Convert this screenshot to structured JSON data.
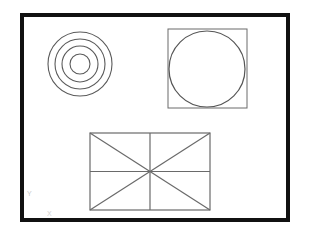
{
  "canvas": {
    "width": 309,
    "height": 232,
    "background_color": "#ffffff",
    "title": "CAD geometric shapes drawing sheet"
  },
  "border_frame": {
    "name": "drawing-border-frame",
    "x": 20,
    "y": 13,
    "width": 270,
    "height": 209,
    "stroke_color": "#111111",
    "stroke_width": 4,
    "fill": "none"
  },
  "shapes": {
    "concentric_circles": {
      "label": "concentric-circles-group",
      "center_x": 80,
      "center_y": 64,
      "stroke_color": "#5a5a5a",
      "stroke_width": 1.1,
      "fill": "none",
      "rings": [
        {
          "name": "ring-outer",
          "radius": 32
        },
        {
          "name": "ring-third",
          "radius": 25
        },
        {
          "name": "ring-second",
          "radius": 18
        },
        {
          "name": "ring-inner",
          "radius": 10
        }
      ]
    },
    "square_with_inscribed_circle": {
      "label": "square-with-inscribed-circle-group",
      "square": {
        "name": "outer-square",
        "x": 168,
        "y": 29,
        "width": 79,
        "height": 79,
        "stroke_color": "#6a6a6a",
        "stroke_width": 1,
        "fill": "none"
      },
      "circle": {
        "name": "inscribed-circle",
        "center_x": 207,
        "center_y": 69,
        "radius": 38,
        "stroke_color": "#555555",
        "stroke_width": 1.2,
        "fill": "none"
      }
    },
    "rectangle_with_diagonals": {
      "label": "rectangle-with-diagonals-group",
      "x": 90,
      "y": 133,
      "width": 120,
      "height": 77,
      "stroke_color": "#6a6a6a",
      "stroke_width": 1.2,
      "fill": "none",
      "center_x": 150,
      "center_y": 171.5,
      "internal_lines": [
        {
          "name": "diagonal-tl-br",
          "x1": 90,
          "y1": 133,
          "x2": 210,
          "y2": 210
        },
        {
          "name": "diagonal-bl-tr",
          "x1": 90,
          "y1": 210,
          "x2": 210,
          "y2": 133
        },
        {
          "name": "midline-horizontal",
          "x1": 90,
          "y1": 171.5,
          "x2": 210,
          "y2": 171.5
        },
        {
          "name": "midline-vertical",
          "x1": 150,
          "y1": 133,
          "x2": 150,
          "y2": 210
        }
      ]
    }
  },
  "annotations": {
    "axis_marks": [
      {
        "name": "axis-mark-y",
        "glyph": "Y",
        "x": 27,
        "y": 196,
        "color": "#c9c9c9",
        "font_size": 7
      },
      {
        "name": "axis-mark-x",
        "glyph": "X",
        "x": 47,
        "y": 216,
        "color": "#d2d2d2",
        "font_size": 7
      }
    ]
  }
}
